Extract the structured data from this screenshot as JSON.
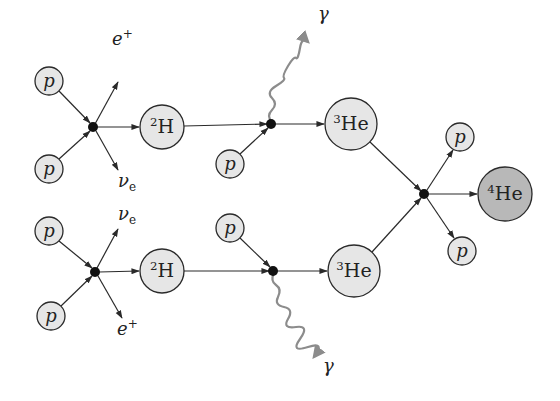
{
  "diagram": {
    "colors": {
      "node_fill": "#e6e6e6",
      "he4_fill": "#b8b8b8",
      "stroke": "#2a2a2a",
      "vertex": "#111111",
      "photon": "#8c8c8c"
    },
    "nodes": [
      {
        "id": "p1",
        "label": "p",
        "italic": true,
        "cx": 49,
        "cy": 81,
        "r": 14
      },
      {
        "id": "p2",
        "label": "p",
        "italic": true,
        "cx": 49,
        "cy": 169,
        "r": 14
      },
      {
        "id": "h2_top",
        "label": "H",
        "sup": "2",
        "cx": 162,
        "cy": 127,
        "r": 22
      },
      {
        "id": "p3",
        "label": "p",
        "italic": true,
        "cx": 230,
        "cy": 164,
        "r": 14
      },
      {
        "id": "he3_top",
        "label": "He",
        "sup": "3",
        "cx": 351,
        "cy": 124,
        "r": 26
      },
      {
        "id": "p4",
        "label": "p",
        "italic": true,
        "cx": 49,
        "cy": 231,
        "r": 14
      },
      {
        "id": "p5",
        "label": "p",
        "italic": true,
        "cx": 51,
        "cy": 316,
        "r": 14
      },
      {
        "id": "h2_bot",
        "label": "H",
        "sup": "2",
        "cx": 162,
        "cy": 271,
        "r": 22
      },
      {
        "id": "p6",
        "label": "p",
        "italic": true,
        "cx": 230,
        "cy": 228,
        "r": 14
      },
      {
        "id": "he3_bot",
        "label": "He",
        "sup": "3",
        "cx": 354,
        "cy": 271,
        "r": 26
      },
      {
        "id": "p7",
        "label": "p",
        "italic": true,
        "cx": 460,
        "cy": 137,
        "r": 14
      },
      {
        "id": "p8",
        "label": "p",
        "italic": true,
        "cx": 462,
        "cy": 251,
        "r": 14
      },
      {
        "id": "he4",
        "label": "He",
        "sup": "4",
        "cx": 505,
        "cy": 194,
        "r": 27,
        "dark": true
      }
    ],
    "vertices": [
      {
        "id": "v1",
        "cx": 93,
        "cy": 127
      },
      {
        "id": "v2",
        "cx": 271,
        "cy": 124
      },
      {
        "id": "v3",
        "cx": 95,
        "cy": 272
      },
      {
        "id": "v4",
        "cx": 273,
        "cy": 271
      },
      {
        "id": "v5",
        "cx": 424,
        "cy": 194
      }
    ],
    "particle_labels": [
      {
        "id": "e_plus_top",
        "text": "e",
        "sup": "+",
        "x": 112,
        "y": 45
      },
      {
        "id": "nu_e_top",
        "text": "ν",
        "sub": "e",
        "x": 118,
        "y": 187
      },
      {
        "id": "gamma_top",
        "text": "γ",
        "x": 318,
        "y": 20
      },
      {
        "id": "nu_e_bot",
        "text": "ν",
        "sub": "e",
        "x": 118,
        "y": 220
      },
      {
        "id": "e_plus_bot",
        "text": "e",
        "sup": "+",
        "x": 117,
        "y": 335
      },
      {
        "id": "gamma_bot",
        "text": "γ",
        "x": 323,
        "y": 372
      }
    ]
  }
}
